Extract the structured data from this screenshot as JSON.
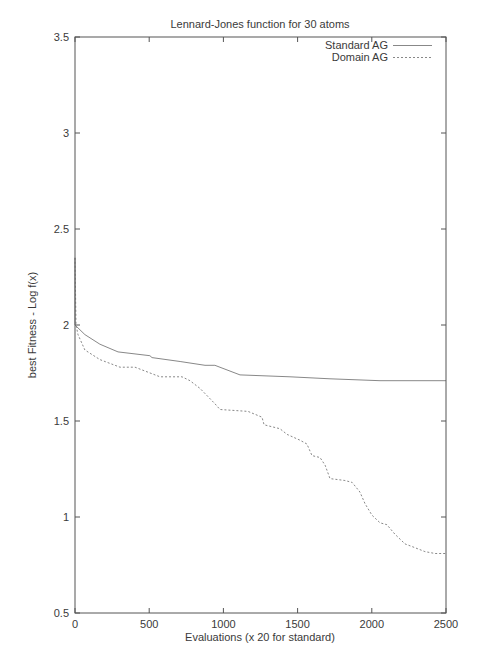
{
  "chart_data": {
    "type": "line",
    "title": "Lennard-Jones function for 30 atoms",
    "xlabel": "Evaluations (x 20 for standard)",
    "ylabel": "best Fitness - Log f(x)",
    "xlim": [
      0,
      2500
    ],
    "ylim": [
      0.5,
      3.5
    ],
    "xticks": [
      0,
      500,
      1000,
      1500,
      2000,
      2500
    ],
    "yticks": [
      0.5,
      1,
      1.5,
      2,
      2.5,
      3,
      3.5
    ],
    "xtick_labels": [
      "0",
      "500",
      "1000",
      "1500",
      "2000",
      "2500"
    ],
    "ytick_labels": [
      "0.5",
      "1",
      "1.5",
      "2",
      "2.5",
      "3",
      "3.5"
    ],
    "grid": false,
    "legend_position": "top-right",
    "series": [
      {
        "name": "Standard AG",
        "style": "solid",
        "x": [
          0,
          0,
          67,
          168,
          290,
          505,
          519,
          708,
          876,
          943,
          1112,
          1449,
          1718,
          2055,
          2500
        ],
        "y": [
          2.35,
          2.0,
          1.95,
          1.9,
          1.86,
          1.84,
          1.83,
          1.81,
          1.79,
          1.79,
          1.74,
          1.73,
          1.72,
          1.71,
          1.71
        ]
      },
      {
        "name": "Domain AG",
        "style": "dashed",
        "x": [
          0,
          7,
          20,
          67,
          168,
          303,
          404,
          573,
          721,
          775,
          842,
          943,
          977,
          1166,
          1260,
          1274,
          1381,
          1429,
          1516,
          1563,
          1597,
          1651,
          1685,
          1718,
          1819,
          1867,
          1920,
          1954,
          2001,
          2055,
          2102,
          2156,
          2224,
          2291,
          2358,
          2426,
          2500
        ],
        "y": [
          2.35,
          2.0,
          1.95,
          1.87,
          1.82,
          1.78,
          1.78,
          1.73,
          1.73,
          1.71,
          1.67,
          1.59,
          1.56,
          1.55,
          1.52,
          1.48,
          1.46,
          1.43,
          1.4,
          1.38,
          1.32,
          1.31,
          1.27,
          1.2,
          1.19,
          1.18,
          1.13,
          1.07,
          1.01,
          0.97,
          0.96,
          0.91,
          0.86,
          0.84,
          0.82,
          0.81,
          0.81
        ]
      }
    ]
  }
}
